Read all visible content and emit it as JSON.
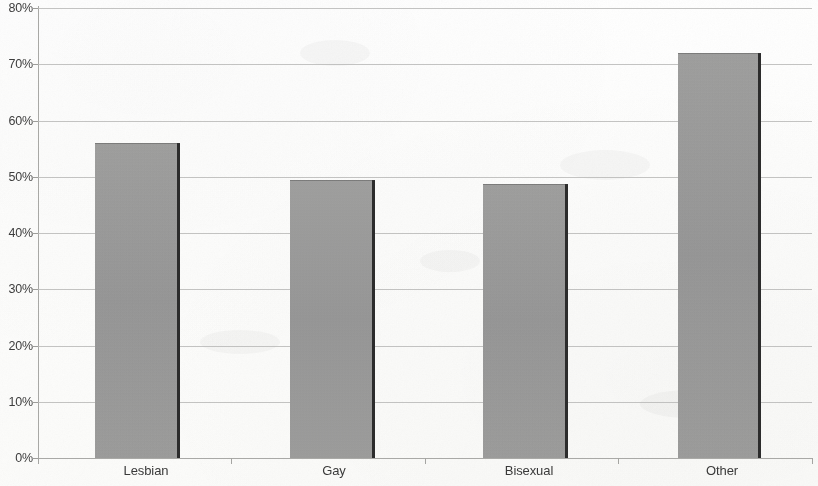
{
  "chart_data": {
    "type": "bar",
    "title": "",
    "subtitle": "",
    "xlabel": "",
    "ylabel": "",
    "categories": [
      "Lesbian",
      "Gay",
      "Bisexual",
      "Other"
    ],
    "values": [
      56,
      49.5,
      48.7,
      72
    ],
    "value_labels": [
      "56%",
      "49.5%",
      "48.7%",
      "72%"
    ],
    "series": [
      {
        "name": "",
        "values": [
          56,
          49.5,
          48.7,
          72
        ]
      }
    ],
    "ylim": [
      0,
      80
    ],
    "y_tick_step": 10,
    "y_tick_labels": [
      "0%",
      "10%",
      "20%",
      "30%",
      "40%",
      "50%",
      "60%",
      "70%",
      "80%"
    ],
    "y_tick_values": [
      0,
      10,
      20,
      30,
      40,
      50,
      60,
      70,
      80
    ],
    "x_tick_labels": [
      "Lesbian",
      "Gay",
      "Bisexual",
      "Other"
    ],
    "grid": true,
    "grid_axis": "y",
    "legend": false,
    "legend_position": "none",
    "annotations": [],
    "colors": {
      "bar_fill": "#9a9a9a",
      "bar_edge": "#2c2c2c",
      "gridline": "#b9b9b7",
      "axis_line": "#a9a9a6",
      "text": "#3a3a3a",
      "background": "#fdfdfc"
    }
  }
}
